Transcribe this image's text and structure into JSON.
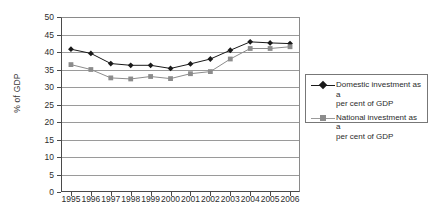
{
  "chart_data": {
    "type": "line",
    "title": "",
    "xlabel": "",
    "ylabel": "% of GDP",
    "categories": [
      "1995",
      "1996",
      "1997",
      "1998",
      "1999",
      "2000",
      "2001",
      "2002",
      "2003",
      "2004",
      "2005",
      "2006"
    ],
    "ylim": [
      0,
      50
    ],
    "ytick_step": 5,
    "yticks": [
      "0",
      "5",
      "10",
      "15",
      "20",
      "25",
      "30",
      "35",
      "40",
      "45",
      "50"
    ],
    "grid": "horizontal",
    "legend_position": "right",
    "series": [
      {
        "name": "Domestic investment as a per cent of GDP",
        "name_line1": "Domestic investment as a",
        "name_line2": "per cent of GDP",
        "color": "#1a1a1a",
        "marker": "diamond",
        "values": [
          40.8,
          39.6,
          36.7,
          36.2,
          36.2,
          35.3,
          36.6,
          38.0,
          40.5,
          42.9,
          42.6,
          42.4
        ]
      },
      {
        "name": "National investment as a per cent of GDP",
        "name_line1": "National investment as a",
        "name_line2": "per cent of GDP",
        "color": "#8c8c8c",
        "marker": "square",
        "values": [
          36.4,
          35.0,
          32.6,
          32.3,
          33.0,
          32.4,
          33.8,
          34.4,
          38.0,
          41.0,
          41.0,
          41.5
        ]
      }
    ]
  },
  "colors": {
    "axis": "#4a4a4a",
    "grid": "#9a9a9a",
    "series1": "#1a1a1a",
    "series2": "#8c8c8c",
    "text": "#2d2d2d",
    "legend_border": "#777777",
    "background": "#ffffff"
  }
}
